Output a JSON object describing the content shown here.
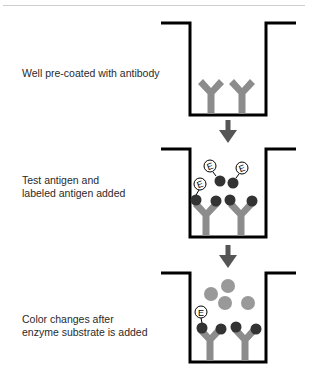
{
  "diagram": {
    "steps": [
      {
        "label": "Well pre-coated with antibody"
      },
      {
        "label": "Test antigen and\nlabeled antigen added"
      },
      {
        "label": "Color changes after\nenzyme substrate is added"
      }
    ],
    "enzyme_label": "E",
    "colors": {
      "well_outline": "#000000",
      "antibody": "#8c8c8c",
      "antigen": "#333333",
      "arrow": "#555555",
      "color_product": "#999999",
      "rule": "#cfcfcf"
    }
  }
}
